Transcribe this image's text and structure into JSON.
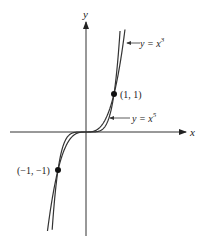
{
  "chart_data": {
    "type": "line",
    "title": "",
    "xlabel": "x",
    "ylabel": "y",
    "series": [
      {
        "name": "y = x^3",
        "label": "y = x³",
        "function": "x^3"
      },
      {
        "name": "y = x^5",
        "label": "y = x⁵",
        "function": "x^5"
      }
    ],
    "points": [
      {
        "label": "(1, 1)",
        "x": 1,
        "y": 1
      },
      {
        "label": "(−1, −1)",
        "x": -1,
        "y": -1
      }
    ],
    "grid": false,
    "legend": "inline annotations with arrows"
  },
  "labels": {
    "x_axis": "x",
    "y_axis": "y",
    "cube_label": "y = x",
    "cube_exp": "3",
    "fifth_label": "y = x",
    "fifth_exp": "5",
    "point_pos": "(1, 1)",
    "point_neg": "(−1, −1)"
  }
}
